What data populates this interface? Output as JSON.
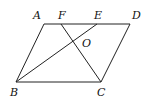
{
  "diagram": {
    "type": "geometry",
    "shape": "parallelogram ABCD",
    "points": {
      "A": {
        "label": "A",
        "x": 44,
        "y": 24,
        "lx": 33,
        "ly": 19
      },
      "F": {
        "label": "F",
        "x": 61,
        "y": 24,
        "lx": 58,
        "ly": 19
      },
      "E": {
        "label": "E",
        "x": 97,
        "y": 24,
        "lx": 94,
        "ly": 19
      },
      "D": {
        "label": "D",
        "x": 130,
        "y": 24,
        "lx": 132,
        "ly": 19
      },
      "O": {
        "label": "O",
        "x": 73,
        "y": 41,
        "lx": 82,
        "ly": 47
      },
      "B": {
        "label": "B",
        "x": 16,
        "y": 82,
        "lx": 10,
        "ly": 96
      },
      "C": {
        "label": "C",
        "x": 101,
        "y": 82,
        "lx": 97,
        "ly": 96
      }
    },
    "segments": [
      [
        "A",
        "D"
      ],
      [
        "A",
        "B"
      ],
      [
        "B",
        "C"
      ],
      [
        "C",
        "D"
      ],
      [
        "B",
        "E"
      ],
      [
        "C",
        "F"
      ]
    ]
  }
}
